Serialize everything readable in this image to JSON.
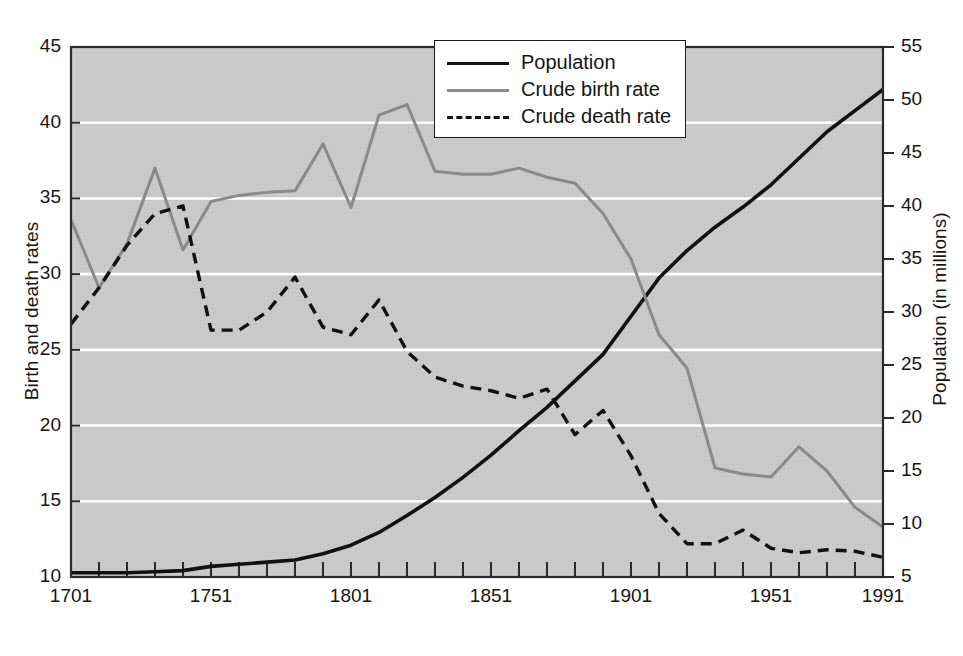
{
  "chart_data": {
    "type": "line",
    "title": "",
    "xlabel": "",
    "ylabel": "Birth and death rates",
    "y2label": "Population (in millions)",
    "xlim": [
      1701,
      1991
    ],
    "ylim": [
      10,
      45
    ],
    "y2lim": [
      5,
      55
    ],
    "grid": true,
    "grid_color": "#ffffff",
    "plot_background": "#c9c9c9",
    "legend_position": "top-center",
    "x_ticks_major": [
      1701,
      1751,
      1801,
      1851,
      1901,
      1951,
      1991
    ],
    "x_tick_interval": 10,
    "y_ticks_left": [
      10,
      15,
      20,
      25,
      30,
      35,
      40,
      45
    ],
    "y_ticks_right": [
      5,
      10,
      15,
      20,
      25,
      30,
      35,
      40,
      45,
      50,
      55
    ],
    "series": [
      {
        "name": "Population",
        "axis": "right",
        "color": "#111111",
        "style": "solid",
        "width": 3.6,
        "x": [
          1701,
          1711,
          1721,
          1731,
          1741,
          1751,
          1761,
          1771,
          1781,
          1791,
          1801,
          1811,
          1821,
          1831,
          1841,
          1851,
          1861,
          1871,
          1881,
          1891,
          1901,
          1911,
          1921,
          1931,
          1941,
          1951,
          1961,
          1971,
          1981,
          1991
        ],
        "values": [
          5.4,
          5.4,
          5.4,
          5.5,
          5.6,
          6.0,
          6.2,
          6.4,
          6.6,
          7.2,
          8.0,
          9.2,
          10.8,
          12.5,
          14.4,
          16.5,
          18.8,
          21.0,
          23.5,
          26.0,
          29.6,
          33.2,
          35.8,
          38.0,
          39.9,
          42.0,
          44.5,
          47.0,
          49.0,
          51.0
        ]
      },
      {
        "name": "Crude birth rate",
        "axis": "left",
        "color": "#8a8a8a",
        "style": "solid",
        "width": 3.0,
        "x": [
          1701,
          1711,
          1721,
          1731,
          1741,
          1751,
          1761,
          1771,
          1781,
          1791,
          1801,
          1811,
          1821,
          1831,
          1841,
          1851,
          1861,
          1871,
          1881,
          1891,
          1901,
          1911,
          1921,
          1931,
          1941,
          1951,
          1961,
          1971,
          1981,
          1991
        ],
        "values": [
          33.6,
          29.1,
          32.0,
          37.0,
          31.6,
          34.8,
          35.2,
          35.4,
          35.5,
          38.6,
          34.4,
          40.5,
          41.2,
          36.8,
          36.6,
          36.6,
          37.0,
          36.4,
          36.0,
          34.0,
          31.0,
          26.0,
          23.8,
          17.2,
          16.8,
          16.6,
          18.6,
          17.0,
          14.6,
          13.3
        ]
      },
      {
        "name": "Crude death rate",
        "axis": "left",
        "color": "#111111",
        "style": "dashed",
        "width": 3.4,
        "x": [
          1701,
          1711,
          1721,
          1731,
          1741,
          1751,
          1761,
          1771,
          1781,
          1791,
          1801,
          1811,
          1821,
          1831,
          1841,
          1851,
          1861,
          1871,
          1881,
          1891,
          1901,
          1911,
          1921,
          1931,
          1941,
          1951,
          1961,
          1971,
          1981,
          1991
        ],
        "values": [
          26.7,
          29.1,
          31.9,
          34.0,
          34.5,
          26.3,
          26.3,
          27.5,
          29.8,
          26.5,
          26.0,
          28.3,
          24.9,
          23.2,
          22.6,
          22.3,
          21.8,
          22.4,
          19.4,
          21.0,
          18.0,
          14.2,
          12.2,
          12.2,
          13.1,
          11.9,
          11.6,
          11.8,
          11.7,
          11.3
        ]
      }
    ]
  },
  "axes": {
    "left_title": "Birth and death rates",
    "right_title": "Population (in millions)",
    "left_ticks": [
      "45",
      "40",
      "35",
      "30",
      "25",
      "20",
      "15",
      "10"
    ],
    "right_ticks": [
      "55",
      "50",
      "45",
      "40",
      "35",
      "30",
      "25",
      "20",
      "15",
      "10",
      "5"
    ],
    "x_ticks": [
      "1701",
      "1751",
      "1801",
      "1851",
      "1901",
      "1951",
      "1991"
    ]
  },
  "legend": {
    "items": [
      {
        "label": "Population",
        "style": "solid-black"
      },
      {
        "label": "Crude birth rate",
        "style": "solid-gray"
      },
      {
        "label": "Crude death rate",
        "style": "dashed-black"
      }
    ]
  }
}
